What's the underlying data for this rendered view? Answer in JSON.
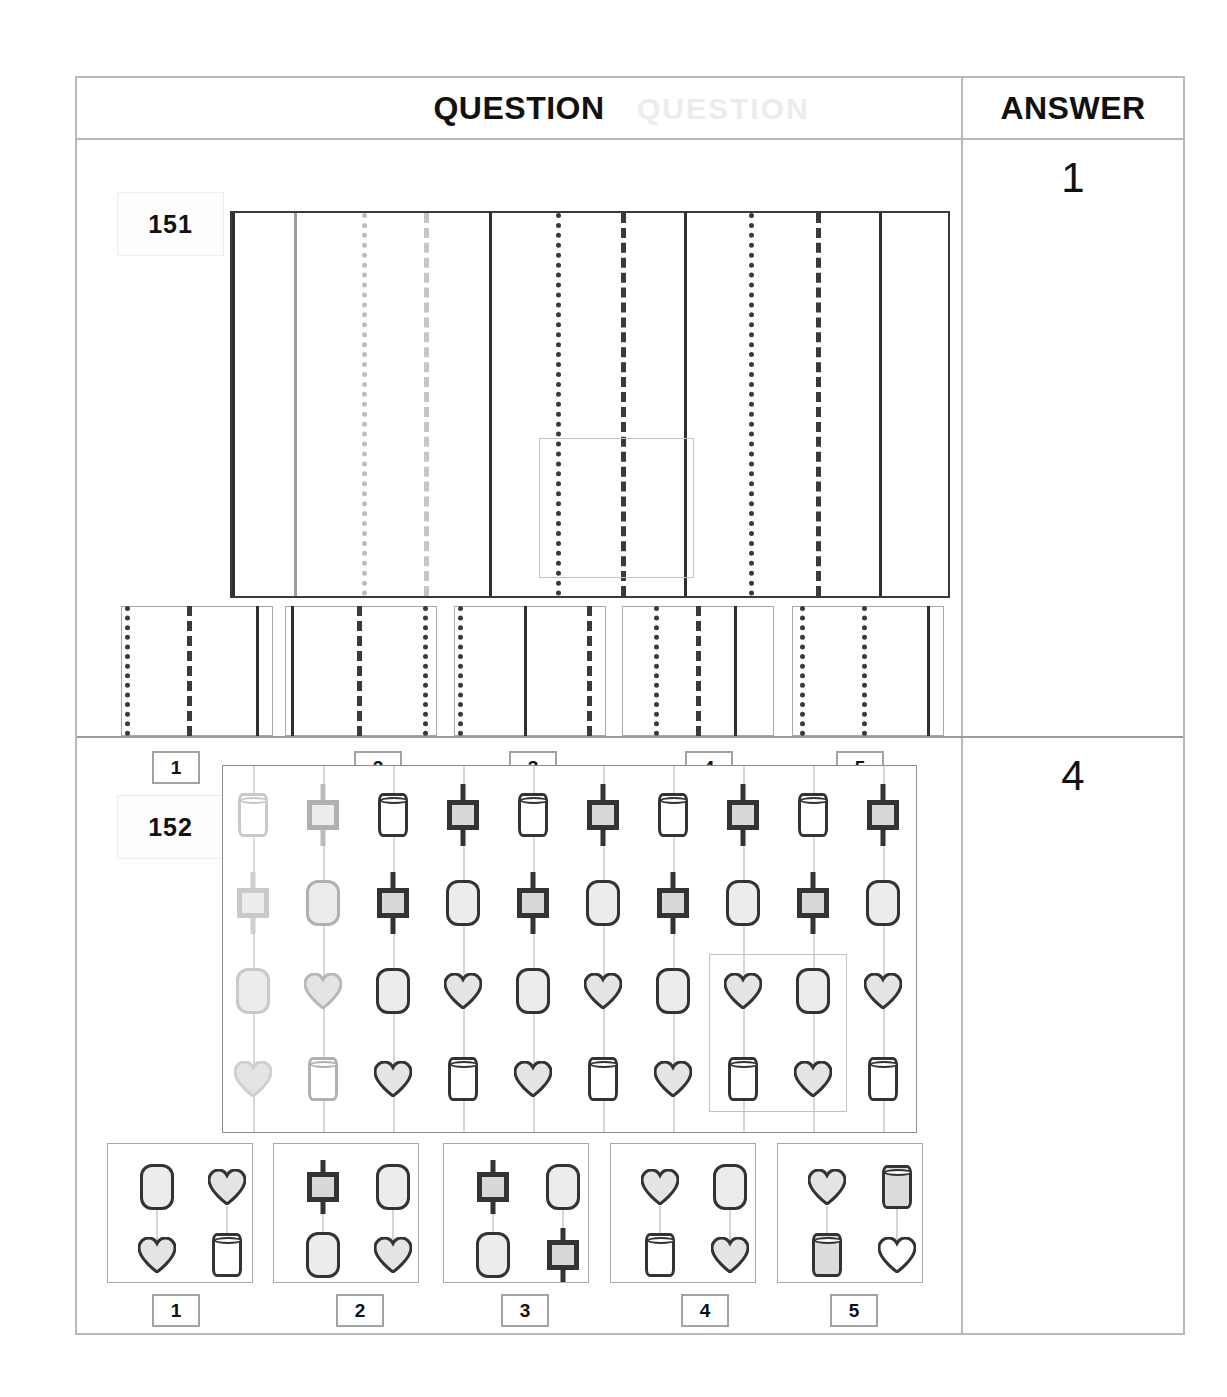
{
  "header": {
    "question_label": "QUESTION",
    "answer_label": "ANSWER",
    "ghost_text": "QUESTION"
  },
  "questions": [
    {
      "number": "151",
      "answer": "1",
      "type": "line-pattern-sequence",
      "stem": {
        "description": "Horizontal strip divided by vertical lines repeating the cycle solid, dotted, dashed",
        "lines": [
          {
            "style": "solid",
            "x": 0,
            "tone": "dark"
          },
          {
            "style": "solid",
            "x": 62,
            "tone": "light"
          },
          {
            "style": "dotted",
            "x": 130,
            "tone": "light"
          },
          {
            "style": "dashed",
            "x": 192,
            "tone": "light"
          },
          {
            "style": "solid",
            "x": 257,
            "tone": "dark"
          },
          {
            "style": "dotted",
            "x": 324,
            "tone": "dark"
          },
          {
            "style": "dashed",
            "x": 389,
            "tone": "dark"
          },
          {
            "style": "solid",
            "x": 452,
            "tone": "dark"
          },
          {
            "style": "dotted",
            "x": 517,
            "tone": "dark"
          },
          {
            "style": "dashed",
            "x": 584,
            "tone": "dark"
          },
          {
            "style": "solid",
            "x": 647,
            "tone": "dark"
          }
        ],
        "highlight": {
          "x": 307,
          "y": 225,
          "w": 155,
          "h": 140
        }
      },
      "options": [
        {
          "label": "1",
          "lines": [
            {
              "style": "dotted",
              "x": 4
            },
            {
              "style": "dashed",
              "x": 66
            },
            {
              "style": "solid",
              "x": 135
            }
          ]
        },
        {
          "label": "2",
          "lines": [
            {
              "style": "solid",
              "x": 6
            },
            {
              "style": "dashed",
              "x": 72
            },
            {
              "style": "dotted",
              "x": 138
            }
          ]
        },
        {
          "label": "3",
          "lines": [
            {
              "style": "dotted",
              "x": 4
            },
            {
              "style": "solid",
              "x": 70
            },
            {
              "style": "dashed",
              "x": 133
            }
          ]
        },
        {
          "label": "4",
          "lines": [
            {
              "style": "dotted",
              "x": 32
            },
            {
              "style": "dashed",
              "x": 74
            },
            {
              "style": "solid",
              "x": 112
            }
          ]
        },
        {
          "label": "5",
          "lines": [
            {
              "style": "dotted",
              "x": 8
            },
            {
              "style": "dotted",
              "x": 70
            },
            {
              "style": "solid",
              "x": 135
            }
          ]
        }
      ]
    },
    {
      "number": "152",
      "answer": "4",
      "type": "hanging-shapes-sequence",
      "stem": {
        "description": "Ten vertical strands, each carrying four shapes; shapes alternate between two interleaved cycles",
        "columns": 10,
        "rows": 4,
        "grid": [
          [
            "cylinder",
            "square",
            "cylinder",
            "square",
            "cylinder",
            "square",
            "cylinder",
            "square",
            "cylinder",
            "square"
          ],
          [
            "square",
            "roundrect",
            "square",
            "roundrect",
            "square",
            "roundrect",
            "square",
            "roundrect",
            "square",
            "roundrect"
          ],
          [
            "roundrect",
            "heart",
            "roundrect",
            "heart",
            "roundrect",
            "heart",
            "roundrect",
            "heart",
            "roundrect",
            "heart"
          ],
          [
            "heart",
            "cylinder",
            "heart",
            "cylinder",
            "heart",
            "cylinder",
            "heart",
            "cylinder",
            "heart",
            "cylinder"
          ]
        ],
        "faded_columns": [
          1,
          2
        ],
        "highlight": {
          "columns": [
            8,
            9
          ],
          "rows": [
            3,
            4
          ]
        }
      },
      "options": [
        {
          "label": "1",
          "cells": [
            "roundrect",
            "heart",
            "heart",
            "cylinder"
          ]
        },
        {
          "label": "2",
          "cells": [
            "square",
            "roundrect",
            "roundrect",
            "heart"
          ]
        },
        {
          "label": "3",
          "cells": [
            "square",
            "roundrect",
            "roundrect",
            "square"
          ]
        },
        {
          "label": "4",
          "cells": [
            "heart",
            "roundrect",
            "cylinder",
            "heart"
          ]
        },
        {
          "label": "5",
          "cells": [
            "heart",
            "cylinder-shaded",
            "cylinder-shaded",
            "heart-plain"
          ]
        }
      ]
    }
  ]
}
